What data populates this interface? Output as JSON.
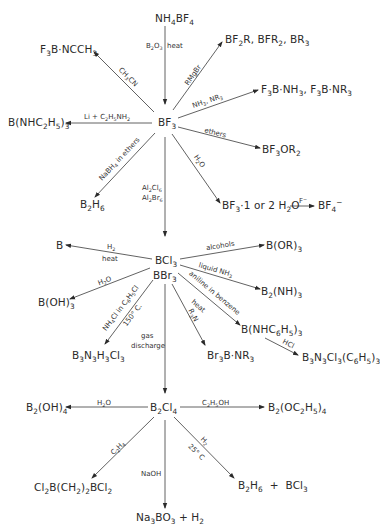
{
  "diagram": {
    "nodes": {
      "nh4bf4": "NH<sub>4</sub>BF<sub>4</sub>",
      "bf3": "BF<sub>3</sub>",
      "f3b_ncch3": "F<sub>3</sub>B·NCCH<sub>3</sub>",
      "bf2r": "BF<sub>2</sub>R, BFR<sub>2</sub>, BR<sub>3</sub>",
      "f3b_nh3": "F<sub>3</sub>B·NH<sub>3</sub>, F<sub>3</sub>B·NR<sub>3</sub>",
      "b_nhc2h5_3": "B(NHC<sub>2</sub>H<sub>5</sub>)<sub>3</sub>",
      "bf3or2": "BF<sub>3</sub>OR<sub>2</sub>",
      "b2h6_top": "B<sub>2</sub>H<sub>6</sub>",
      "bf3_h2o": "BF<sub>3</sub>·1 or 2 H<sub>2</sub>O",
      "bf4": "BF<sub>4</sub><sup>−</sup>",
      "b": "B",
      "bcl3": "BCl<sub>3</sub>",
      "bbr3": "BBr<sub>3</sub>",
      "b_or_3": "B(OR)<sub>3</sub>",
      "b2_nh_3": "B<sub>2</sub>(NH)<sub>3</sub>",
      "b_oh_3": "B(OH)<sub>3</sub>",
      "b_nhc6h5_3": "B(NHC<sub>6</sub>H<sub>5</sub>)<sub>3</sub>",
      "b3n3h3cl3": "B<sub>3</sub>N<sub>3</sub>H<sub>3</sub>Cl<sub>3</sub>",
      "br3b_nr3": "Br<sub>3</sub>B·NR<sub>3</sub>",
      "b3n3cl3_c6h5_3": "B<sub>3</sub>N<sub>3</sub>Cl<sub>3</sub>(C<sub>6</sub>H<sub>5</sub>)<sub>3</sub>",
      "b2cl4": "B<sub>2</sub>Cl<sub>4</sub>",
      "b2_oh_4": "B<sub>2</sub>(OH)<sub>4</sub>",
      "b2_oc2h5_4": "B<sub>2</sub>(OC<sub>2</sub>H<sub>5</sub>)<sub>4</sub>",
      "cl2b_ch2_2_bcl2": "Cl<sub>2</sub>B(CH<sub>2</sub>)<sub>2</sub>BCl<sub>2</sub>",
      "b2h6_bcl3": "B<sub>2</sub>H<sub>6</sub> &nbsp;+ &nbsp;BCl<sub>3</sub>",
      "na3bo3_h2": "Na<sub>3</sub>BO<sub>3</sub> + H<sub>2</sub>"
    },
    "labels": {
      "b2o3_heat": "B<sub>2</sub>O<sub>3</sub> &nbsp;heat",
      "ch3cn": "CH<sub>3</sub>CN",
      "rmgbr": "RMgBr",
      "nh3_nr3": "NH<sub>3</sub>, NR<sub>3</sub>",
      "li_c2h5nh2": "Li + C<sub>2</sub>H<sub>5</sub>NH<sub>2</sub>",
      "ethers": "ethers",
      "nabh4_ethers": "NaBH<sub>4</sub> in ethers",
      "h2o_bf3": "H<sub>2</sub>O",
      "al2cl6": "Al<sub>2</sub>Cl<sub>6</sub>",
      "al2br6": "Al<sub>2</sub>Br<sub>6</sub>",
      "f_minus": "F<sup>−</sup>",
      "h2": "H<sub>2</sub>",
      "heat": "heat",
      "alcohols": "alcohols",
      "liquid_nh3": "liquid NH<sub>3</sub>",
      "h2o_bcl3": "H<sub>2</sub>O",
      "aniline_benzene": "aniline in benzene",
      "heat2": "heat",
      "nh4cl_c6h5cl": "NH<sub>4</sub>Cl in C<sub>6</sub>H<sub>5</sub>Cl",
      "temp_150": "150° C.",
      "r3n": "R<sub>3</sub>N",
      "gas": "gas",
      "discharge": "discharge",
      "hcl": "HCl",
      "h2o_b2cl4": "H<sub>2</sub>O",
      "c2h5oh": "C<sub>2</sub>H<sub>5</sub>OH",
      "c2h4": "C<sub>2</sub>H<sub>4</sub>",
      "naoh": "NaOH",
      "h2_b2cl4": "H<sub>2</sub>",
      "temp_25": "25° C"
    }
  }
}
